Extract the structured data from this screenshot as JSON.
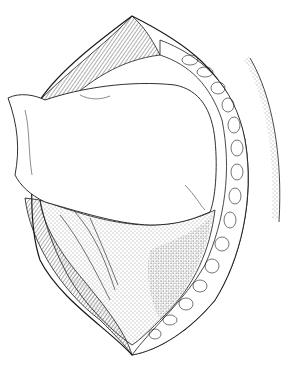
{
  "figure": {
    "type": "surgical-line-illustration",
    "colors": {
      "ink": "#1a1a1a",
      "paper": "#ffffff",
      "stipple": "#555555"
    },
    "elements": [
      "incision-outline",
      "fat-lobule-layer-right",
      "muscle-fiber-layer-left",
      "retracted-tissue-mass",
      "exposed-cavity-stippled",
      "skin-edge-stipple-right"
    ]
  }
}
